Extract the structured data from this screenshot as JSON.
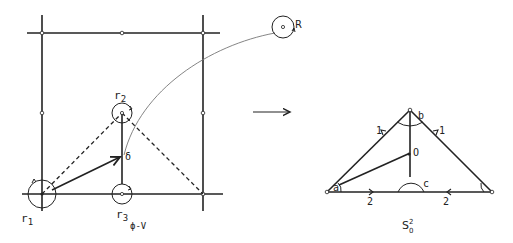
{
  "left_figure": {
    "labels": {
      "r1": "r",
      "r1_sub": "1",
      "r2": "r",
      "r2_sub": "2",
      "r3": "r",
      "r3_sub": "3",
      "delta": "δ",
      "R": "R",
      "phi_v": "ϕ-V"
    }
  },
  "arrow": {
    "symbol": "⟶"
  },
  "right_figure": {
    "labels": {
      "a": "a",
      "b": "b",
      "c": "c",
      "O": "O",
      "edge_left": "1",
      "edge_right": "1",
      "base_left": "2",
      "base_right": "2",
      "caption": "S",
      "caption_sup": "2",
      "caption_sub": "0"
    }
  },
  "colors": {
    "ink": "#222222",
    "curve": "#777777"
  }
}
